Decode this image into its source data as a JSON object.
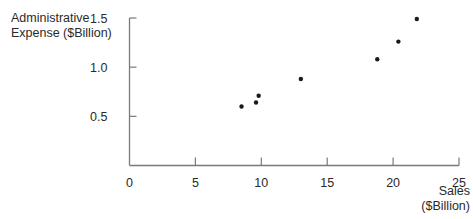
{
  "chart_data": {
    "type": "scatter",
    "title": "",
    "xlabel": "Sales ($Billion)",
    "ylabel": "Administrative Expense ($Billion)",
    "xlim": [
      0,
      25
    ],
    "ylim": [
      0,
      1.5
    ],
    "x_ticks": [
      "0",
      "5",
      "10",
      "15",
      "20",
      "25"
    ],
    "y_ticks": [
      "0.5",
      "1.0",
      "1.5"
    ],
    "grid": false,
    "legend": null,
    "points": [
      {
        "x": 8.5,
        "y": 0.6
      },
      {
        "x": 9.6,
        "y": 0.64
      },
      {
        "x": 9.8,
        "y": 0.71
      },
      {
        "x": 13.0,
        "y": 0.88
      },
      {
        "x": 18.8,
        "y": 1.08
      },
      {
        "x": 20.4,
        "y": 1.26
      },
      {
        "x": 21.8,
        "y": 1.49
      }
    ]
  },
  "labels": {
    "ylabel_line1": "Administrative",
    "ylabel_line2": "Expense ($Billion)",
    "xlabel_line1": "Sales",
    "xlabel_line2": "($Billion)"
  },
  "colors": {
    "axis": "#7a7a7a",
    "point": "#1a1a1a",
    "text": "#2a2a2a"
  }
}
